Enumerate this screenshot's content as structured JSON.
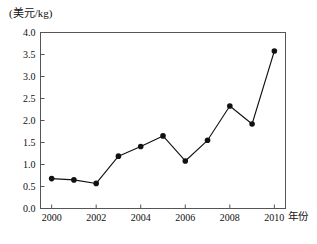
{
  "chart_data": {
    "type": "line",
    "title": "",
    "subtitle": "",
    "xlabel": "年份",
    "ylabel": "(美元/kg)",
    "ylabel_position": "above-axis",
    "x": [
      2000,
      2001,
      2002,
      2003,
      2004,
      2005,
      2006,
      2007,
      2008,
      2009,
      2010
    ],
    "values": [
      0.68,
      0.65,
      0.57,
      1.19,
      1.41,
      1.65,
      1.08,
      1.55,
      2.33,
      1.92,
      3.58
    ],
    "categories": [
      "2000",
      "2001",
      "2002",
      "2003",
      "2004",
      "2005",
      "2006",
      "2007",
      "2008",
      "2009",
      "2010"
    ],
    "xlim": [
      1999.5,
      2010.5
    ],
    "ylim": [
      0.0,
      4.0
    ],
    "yticks": [
      0.0,
      0.5,
      1.0,
      1.5,
      2.0,
      2.5,
      3.0,
      3.5,
      4.0
    ],
    "ytick_labels": [
      "0.0",
      "0.5",
      "1.0",
      "1.5",
      "2.0",
      "2.5",
      "3.0",
      "3.5",
      "4.0"
    ],
    "xticks": [
      2000,
      2002,
      2004,
      2006,
      2008,
      2010
    ],
    "xtick_labels": [
      "2000",
      "2002",
      "2004",
      "2006",
      "2008",
      "2010"
    ],
    "grid": false,
    "legend": "none",
    "marker": "filled-circle",
    "line_color": "#111111",
    "marker_color": "#111111",
    "frame_color": "#555555",
    "background": "#ffffff"
  },
  "axis": {
    "unit_label": "(美元/kg)",
    "x_title": "年份"
  }
}
